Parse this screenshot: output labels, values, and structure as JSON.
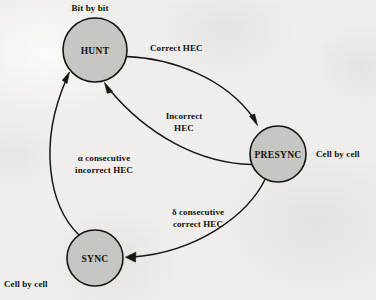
{
  "figure": {
    "background_color": "#f1f0ee",
    "node_fill_color": "#c6c6c3",
    "stroke_color": "#17160f"
  },
  "states": [
    {
      "id": "hunt",
      "label": "HUNT",
      "cx": 95,
      "cy": 50,
      "r": 32
    },
    {
      "id": "presync",
      "label": "PRESYNC",
      "cx": 278,
      "cy": 154,
      "r": 28
    },
    {
      "id": "sync",
      "label": "SYNC",
      "cx": 95,
      "cy": 258,
      "r": 28
    }
  ],
  "state_annotations": [
    {
      "id": "hunt-mode",
      "text": "Bit by bit",
      "x": 90,
      "y": 3
    },
    {
      "id": "presync-mode",
      "text": "Cell by cell",
      "x": 316,
      "y": 149
    },
    {
      "id": "sync-mode",
      "text": "Cell by cell",
      "x": 4,
      "y": 279
    }
  ],
  "transitions": [
    {
      "id": "hunt-to-presync",
      "from": "HUNT",
      "to": "PRESYNC",
      "label_lines": [
        "Correct HEC"
      ],
      "label_x": 150,
      "label_y": 43
    },
    {
      "id": "presync-to-hunt",
      "from": "PRESYNC",
      "to": "HUNT",
      "label_lines": [
        "Incorrect",
        "HEC"
      ],
      "label_x": 184,
      "label_y": 111
    },
    {
      "id": "presync-to-sync",
      "from": "PRESYNC",
      "to": "SYNC",
      "greek": "δ",
      "label_lines": [
        "δ consecutive",
        "correct HEC"
      ],
      "label_x": 198,
      "label_y": 207
    },
    {
      "id": "sync-to-hunt",
      "from": "SYNC",
      "to": "HUNT",
      "greek": "α",
      "label_lines": [
        "α consecutive",
        "incorrect HEC"
      ],
      "label_x": 104,
      "label_y": 153
    }
  ],
  "greek_symbols": {
    "alpha": "α",
    "delta": "δ"
  }
}
